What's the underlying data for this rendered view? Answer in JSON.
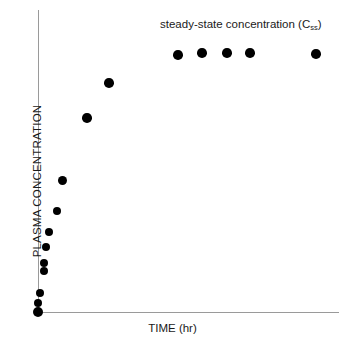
{
  "chart_data": {
    "type": "scatter",
    "title": "",
    "xlabel": "TIME (hr)",
    "ylabel": "PLASMA CONCENTRATION",
    "annotations": [
      {
        "name": "steady-state-annotation",
        "text_main": "steady-state concentration (C",
        "text_sub": "ss",
        "text_close": ")",
        "full_text": "steady-state concentration (Css)"
      }
    ],
    "grid": false,
    "legend": null,
    "axis_color": "#9a9a9a",
    "point_color": "#000000",
    "xlim": [
      0,
      24
    ],
    "ylim": [
      0,
      110
    ],
    "x_tick_labels": [],
    "y_tick_labels": [],
    "series": [
      {
        "name": "plasma concentration",
        "points": [
          {
            "x": 0.0,
            "y": 0
          },
          {
            "x": 0.0,
            "y": 5
          },
          {
            "x": 0.05,
            "y": 11
          },
          {
            "x": 0.3,
            "y": 25
          },
          {
            "x": 0.3,
            "y": 29
          },
          {
            "x": 0.45,
            "y": 39
          },
          {
            "x": 0.6,
            "y": 48
          },
          {
            "x": 0.9,
            "y": 59
          },
          {
            "x": 1.2,
            "y": 67
          },
          {
            "x": 2.6,
            "y": 80
          },
          {
            "x": 3.6,
            "y": 88
          },
          {
            "x": 7.0,
            "y": 95
          },
          {
            "x": 9.0,
            "y": 96
          },
          {
            "x": 11.0,
            "y": 96
          },
          {
            "x": 13.2,
            "y": 96
          },
          {
            "x": 20.0,
            "y": 96
          }
        ]
      }
    ],
    "pixel_points": [
      {
        "cx": 38,
        "cy": 312,
        "r": 5.0
      },
      {
        "cx": 38,
        "cy": 303,
        "r": 4.2
      },
      {
        "cx": 40,
        "cy": 293,
        "r": 4.2
      },
      {
        "cx": 44,
        "cy": 271,
        "r": 4.2
      },
      {
        "cx": 44,
        "cy": 263,
        "r": 4.2
      },
      {
        "cx": 46,
        "cy": 247,
        "r": 4.2
      },
      {
        "cx": 49,
        "cy": 232,
        "r": 4.2
      },
      {
        "cx": 57,
        "cy": 211,
        "r": 4.2
      },
      {
        "cx": 62,
        "cy": 180,
        "r": 4.5
      },
      {
        "cx": 87,
        "cy": 118,
        "r": 4.8
      },
      {
        "cx": 109,
        "cy": 83,
        "r": 4.8
      },
      {
        "cx": 178,
        "cy": 55,
        "r": 4.8
      },
      {
        "cx": 202,
        "cy": 53,
        "r": 4.8
      },
      {
        "cx": 227,
        "cy": 53,
        "r": 4.8
      },
      {
        "cx": 250,
        "cy": 53,
        "r": 4.8
      },
      {
        "cx": 316,
        "cy": 54,
        "r": 4.8
      }
    ]
  }
}
